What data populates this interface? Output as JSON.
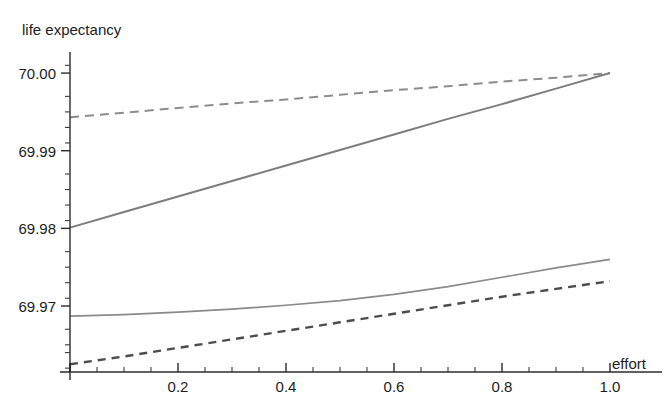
{
  "chart_data": {
    "type": "line",
    "title": "",
    "xlabel": "effort",
    "ylabel": "life expectancy",
    "xlim": [
      0,
      1.05
    ],
    "ylim": [
      69.9615,
      70.0022
    ],
    "grid": false,
    "legend": "none",
    "x_ticks": [
      0,
      0.2,
      0.4,
      0.6,
      0.8,
      1.0
    ],
    "x_tick_labels": [
      "",
      "0.2",
      "0.4",
      "0.6",
      "0.8",
      "1.0"
    ],
    "x_minor_step": 0.05,
    "y_ticks": [
      69.97,
      69.98,
      69.99,
      70.0
    ],
    "y_tick_labels": [
      "69.97",
      "69.98",
      "69.99",
      "70.00"
    ],
    "y_minor_step": 0.002,
    "x": [
      0,
      0.1,
      0.2,
      0.3,
      0.4,
      0.5,
      0.6,
      0.7,
      0.8,
      0.9,
      1.0
    ],
    "series": [
      {
        "name": "upper-dashed",
        "style": "dashed",
        "color": "#8c8c8c",
        "width": 2.0,
        "dash": "9,6",
        "values": [
          69.9943,
          69.9949,
          69.9955,
          69.9961,
          69.9966,
          69.9972,
          69.9978,
          69.9983,
          69.9989,
          69.9994,
          70.0
        ]
      },
      {
        "name": "upper-solid",
        "style": "solid",
        "color": "#7d7d7d",
        "width": 2.0,
        "dash": "none",
        "values": [
          69.9801,
          69.9821,
          69.9841,
          69.9861,
          69.9881,
          69.9901,
          69.9921,
          69.9941,
          69.996,
          69.998,
          70.0
        ]
      },
      {
        "name": "lower-solid",
        "style": "solid",
        "color": "#8a8a8a",
        "width": 1.7,
        "dash": "none",
        "values": [
          69.9687,
          69.9689,
          69.9692,
          69.9696,
          69.9701,
          69.9707,
          69.9715,
          69.9725,
          69.9737,
          69.9749,
          69.976
        ]
      },
      {
        "name": "lower-dashed",
        "style": "dashed",
        "color": "#4c4c4c",
        "width": 2.4,
        "dash": "8,6",
        "values": [
          69.9625,
          69.9635,
          69.9646,
          69.9657,
          69.9668,
          69.9679,
          69.969,
          69.9701,
          69.9712,
          69.9722,
          69.9732
        ]
      }
    ]
  },
  "labels": {
    "y_axis_title": "life expectancy",
    "x_axis_title": "effort"
  }
}
